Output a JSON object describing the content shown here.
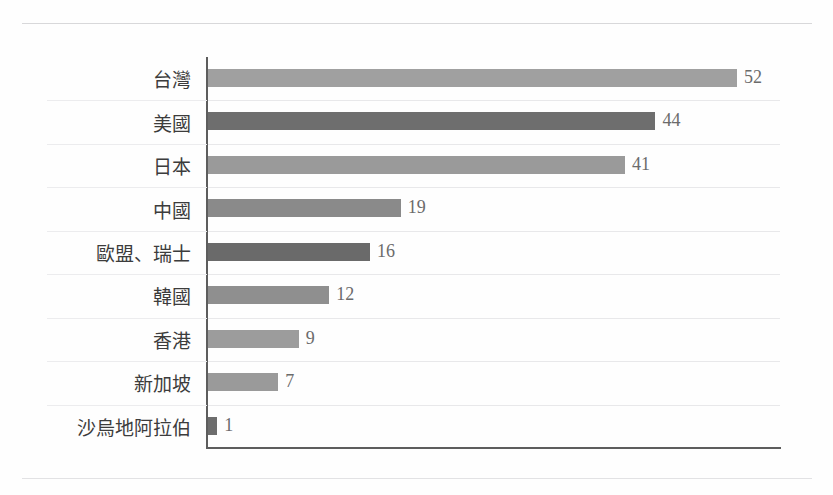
{
  "chart_data": {
    "type": "bar",
    "orientation": "horizontal",
    "title": "",
    "subtitle": "",
    "xlabel": "",
    "ylabel": "",
    "grid": true,
    "legend": "none",
    "xlim": [
      0,
      56
    ],
    "categories": [
      "台灣",
      "美國",
      "日本",
      "中國",
      "歐盟、瑞士",
      "韓國",
      "香港",
      "新加坡",
      "沙烏地阿拉伯"
    ],
    "values": [
      52,
      44,
      41,
      19,
      16,
      12,
      9,
      7,
      1
    ],
    "value_labels": [
      "52",
      "44",
      "41",
      "19",
      "16",
      "12",
      "9",
      "7",
      "1"
    ],
    "bar_colors": [
      "#a0a0a0",
      "#6e6e6e",
      "#9a9a9a",
      "#8a8a8a",
      "#6a6a6a",
      "#8f8f8f",
      "#9c9c9c",
      "#9a9a9a",
      "#6d6d6d"
    ]
  },
  "axis": {
    "line_color": "#5d5d5d",
    "grid_color": "#e8e8ea"
  },
  "page": {
    "background": "#fefefe",
    "rule_color": "#d8d8da"
  }
}
